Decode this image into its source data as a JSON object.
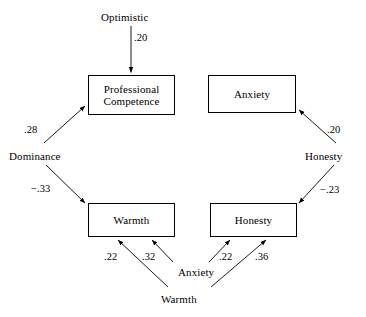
{
  "diagram": {
    "line_color": "#000000",
    "background_color": "#ffffff",
    "boxes": [
      {
        "id": "professional-competence",
        "label": "Professional\nCompetence",
        "x": 88,
        "y": 75,
        "w": 87,
        "h": 40
      },
      {
        "id": "anxiety-top",
        "label": "Anxiety",
        "x": 208,
        "y": 75,
        "w": 88,
        "h": 38
      },
      {
        "id": "warmth-box",
        "label": "Warmth",
        "x": 88,
        "y": 203,
        "w": 87,
        "h": 34
      },
      {
        "id": "honesty-box",
        "label": "Honesty",
        "x": 210,
        "y": 203,
        "w": 87,
        "h": 34
      }
    ],
    "labels": [
      {
        "id": "optimistic",
        "text": "Optimistic",
        "x": 101,
        "y": 11
      },
      {
        "id": "dominance",
        "text": "Dominance",
        "x": 9,
        "y": 150
      },
      {
        "id": "honesty-source",
        "text": "Honesty",
        "x": 305,
        "y": 150
      },
      {
        "id": "anxiety-source",
        "text": "Anxiety",
        "x": 178,
        "y": 266
      },
      {
        "id": "warmth-source",
        "text": "Warmth",
        "x": 161,
        "y": 293
      }
    ],
    "coefficients": [
      {
        "id": "optimistic-to-competence",
        "value": ".20",
        "x": 134,
        "y": 32
      },
      {
        "id": "dominance-to-competence",
        "value": ".28",
        "x": 24,
        "y": 124
      },
      {
        "id": "dominance-to-warmth",
        "value": "−.33",
        "x": 31,
        "y": 183
      },
      {
        "id": "honesty-to-anxiety",
        "value": ".20",
        "x": 327,
        "y": 124
      },
      {
        "id": "honesty-to-honestybox",
        "value": "−.23",
        "x": 320,
        "y": 184
      },
      {
        "id": "anxiety-to-warmth",
        "value": ".22",
        "x": 104,
        "y": 251
      },
      {
        "id": "warmth-to-warmthbox",
        "value": ".32",
        "x": 142,
        "y": 251
      },
      {
        "id": "anxiety-to-honestybox",
        "value": ".22",
        "x": 219,
        "y": 251
      },
      {
        "id": "warmth-to-honestybox",
        "value": ".36",
        "x": 255,
        "y": 251
      }
    ],
    "edges": [
      {
        "id": "optimistic-to-competence",
        "from": "Optimistic",
        "to": "Professional Competence",
        "coefficient": ".20"
      },
      {
        "id": "dominance-to-competence",
        "from": "Dominance",
        "to": "Professional Competence",
        "coefficient": ".28"
      },
      {
        "id": "dominance-to-warmth",
        "from": "Dominance",
        "to": "Warmth",
        "coefficient": "−.33"
      },
      {
        "id": "honesty-to-anxiety",
        "from": "Honesty",
        "to": "Anxiety",
        "coefficient": ".20"
      },
      {
        "id": "honesty-to-honestybox",
        "from": "Honesty",
        "to": "Honesty",
        "coefficient": "−.23"
      },
      {
        "id": "anxiety-to-warmth",
        "from": "Anxiety",
        "to": "Warmth",
        "coefficient": ".22"
      },
      {
        "id": "warmth-to-warmthbox",
        "from": "Warmth",
        "to": "Warmth",
        "coefficient": ".32"
      },
      {
        "id": "anxiety-to-honestybox",
        "from": "Anxiety",
        "to": "Honesty",
        "coefficient": ".22"
      },
      {
        "id": "warmth-to-honestybox",
        "from": "Warmth",
        "to": "Honesty",
        "coefficient": ".36"
      }
    ]
  }
}
